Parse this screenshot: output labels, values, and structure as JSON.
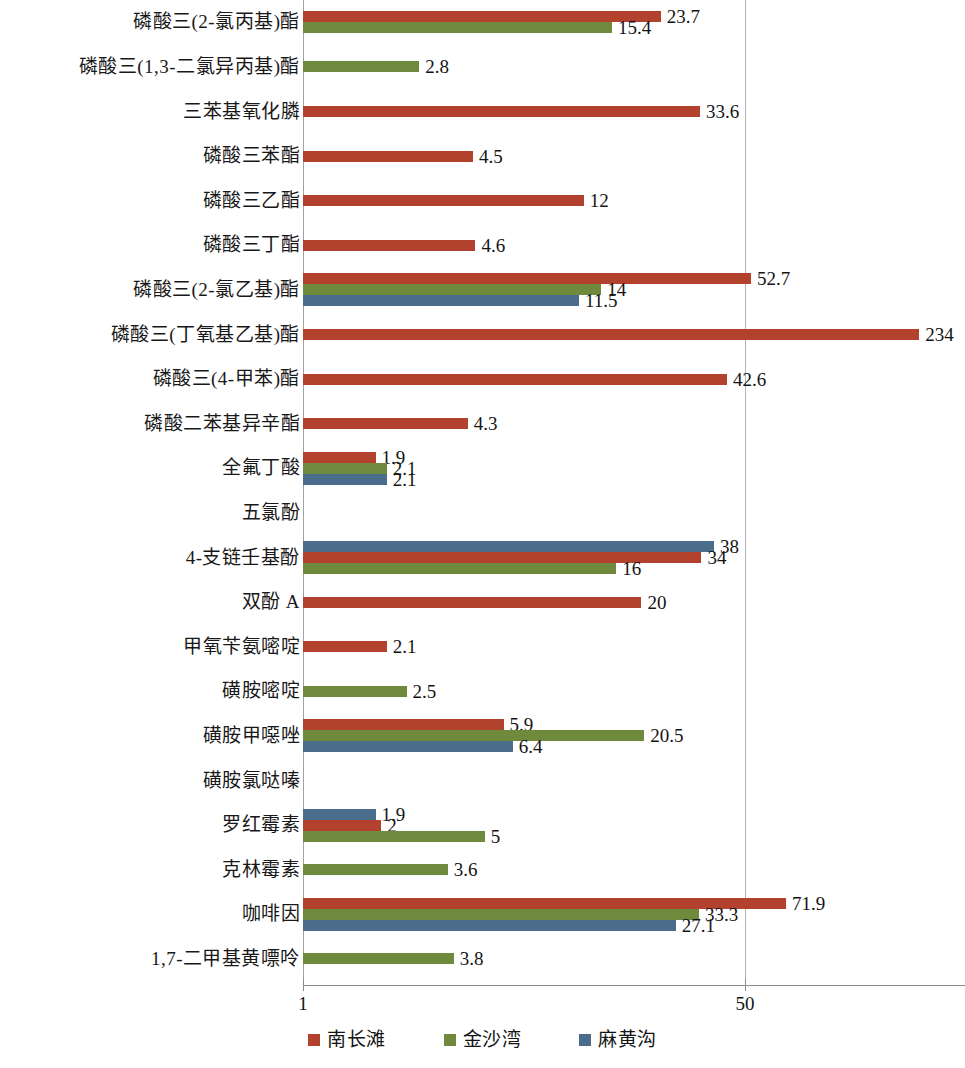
{
  "chart_data": {
    "type": "bar",
    "orientation": "horizontal",
    "title": "",
    "xlabel": "",
    "ylabel": "",
    "xscale": "log",
    "xlim": [
      1,
      300
    ],
    "xticks": [
      1,
      50
    ],
    "xticklabels": [
      "1",
      "50"
    ],
    "grid": true,
    "legend_position": "bottom",
    "colors": {
      "nanchangtan": "#b2412e",
      "jinshawan": "#6f8a3c",
      "mahuanggou": "#4a6d8c"
    },
    "series": [
      {
        "name": "南长滩",
        "color": "#b2412e"
      },
      {
        "name": "金沙湾",
        "color": "#6f8a3c"
      },
      {
        "name": "麻黄沟",
        "color": "#4a6d8c"
      }
    ],
    "categories": [
      "磷酸三(2-氯丙基)酯",
      "磷酸三(1,3-二氯异丙基)酯",
      "三苯基氧化膦",
      "磷酸三苯酯",
      "磷酸三乙酯",
      "磷酸三丁酯",
      "磷酸三(2-氯乙基)酯",
      "磷酸三(丁氧基乙基)酯",
      "磷酸三(4-甲苯)酯",
      "磷酸二苯基异辛酯",
      "全氟丁酸",
      "五氯酚",
      "4-支链壬基酚",
      "双酚 A",
      "甲氧苄氨嘧啶",
      "磺胺嘧啶",
      "磺胺甲噁唑",
      "磺胺氯哒嗪",
      "罗红霉素",
      "克林霉素",
      "咖啡因",
      "1,7-二甲基黄嘌呤"
    ],
    "rows": [
      {
        "category": "磷酸三(2-氯丙基)酯",
        "bars": [
          {
            "series": "南长滩",
            "value": 23.7,
            "label": "23.7"
          },
          {
            "series": "金沙湾",
            "value": 15.4,
            "label": "15.4"
          }
        ]
      },
      {
        "category": "磷酸三(1,3-二氯异丙基)酯",
        "bars": [
          {
            "series": "金沙湾",
            "value": 2.8,
            "label": "2.8"
          }
        ]
      },
      {
        "category": "三苯基氧化膦",
        "bars": [
          {
            "series": "南长滩",
            "value": 33.6,
            "label": "33.6"
          }
        ]
      },
      {
        "category": "磷酸三苯酯",
        "bars": [
          {
            "series": "南长滩",
            "value": 4.5,
            "label": "4.5"
          }
        ]
      },
      {
        "category": "磷酸三乙酯",
        "bars": [
          {
            "series": "南长滩",
            "value": 12,
            "label": "12"
          }
        ]
      },
      {
        "category": "磷酸三丁酯",
        "bars": [
          {
            "series": "南长滩",
            "value": 4.6,
            "label": "4.6"
          }
        ]
      },
      {
        "category": "磷酸三(2-氯乙基)酯",
        "bars": [
          {
            "series": "南长滩",
            "value": 52.7,
            "label": "52.7"
          },
          {
            "series": "金沙湾",
            "value": 14,
            "label": "14"
          },
          {
            "series": "麻黄沟",
            "value": 11.5,
            "label": "11.5"
          }
        ]
      },
      {
        "category": "磷酸三(丁氧基乙基)酯",
        "bars": [
          {
            "series": "南长滩",
            "value": 234,
            "label": "234"
          }
        ]
      },
      {
        "category": "磷酸三(4-甲苯)酯",
        "bars": [
          {
            "series": "南长滩",
            "value": 42.6,
            "label": "42.6"
          }
        ]
      },
      {
        "category": "磷酸二苯基异辛酯",
        "bars": [
          {
            "series": "南长滩",
            "value": 4.3,
            "label": "4.3"
          }
        ]
      },
      {
        "category": "全氟丁酸",
        "bars": [
          {
            "series": "南长滩",
            "value": 1.9,
            "label": "1.9"
          },
          {
            "series": "金沙湾",
            "value": 2.1,
            "label": "2.1"
          },
          {
            "series": "麻黄沟",
            "value": 2.1,
            "label": "2.1"
          }
        ]
      },
      {
        "category": "五氯酚",
        "bars": []
      },
      {
        "category": "4-支链壬基酚",
        "bars": [
          {
            "series": "麻黄沟",
            "value": 38,
            "label": "38"
          },
          {
            "series": "南长滩",
            "value": 34,
            "label": "34"
          },
          {
            "series": "金沙湾",
            "value": 16,
            "label": "16"
          }
        ]
      },
      {
        "category": "双酚 A",
        "bars": [
          {
            "series": "南长滩",
            "value": 20,
            "label": "20"
          }
        ]
      },
      {
        "category": "甲氧苄氨嘧啶",
        "bars": [
          {
            "series": "南长滩",
            "value": 2.1,
            "label": "2.1"
          }
        ]
      },
      {
        "category": "磺胺嘧啶",
        "bars": [
          {
            "series": "金沙湾",
            "value": 2.5,
            "label": "2.5"
          }
        ]
      },
      {
        "category": "磺胺甲噁唑",
        "bars": [
          {
            "series": "南长滩",
            "value": 5.9,
            "label": "5.9"
          },
          {
            "series": "金沙湾",
            "value": 20.5,
            "label": "20.5"
          },
          {
            "series": "麻黄沟",
            "value": 6.4,
            "label": "6.4"
          }
        ]
      },
      {
        "category": "磺胺氯哒嗪",
        "bars": []
      },
      {
        "category": "罗红霉素",
        "bars": [
          {
            "series": "麻黄沟",
            "value": 1.9,
            "label": "1.9"
          },
          {
            "series": "南长滩",
            "value": 2,
            "label": "2"
          },
          {
            "series": "金沙湾",
            "value": 5,
            "label": "5"
          }
        ]
      },
      {
        "category": "克林霉素",
        "bars": [
          {
            "series": "金沙湾",
            "value": 3.6,
            "label": "3.6"
          }
        ]
      },
      {
        "category": "咖啡因",
        "bars": [
          {
            "series": "南长滩",
            "value": 71.9,
            "label": "71.9"
          },
          {
            "series": "金沙湾",
            "value": 33.3,
            "label": "33.3"
          },
          {
            "series": "麻黄沟",
            "value": 27.1,
            "label": "27.1"
          }
        ]
      },
      {
        "category": "1,7-二甲基黄嘌呤",
        "bars": [
          {
            "series": "金沙湾",
            "value": 3.8,
            "label": "3.8"
          }
        ]
      }
    ]
  },
  "legend": {
    "items": [
      {
        "label": "南长滩",
        "color": "#b2412e"
      },
      {
        "label": "金沙湾",
        "color": "#6f8a3c"
      },
      {
        "label": "麻黄沟",
        "color": "#4a6d8c"
      }
    ]
  },
  "axis": {
    "ticks": [
      {
        "label": "1",
        "value": 1
      },
      {
        "label": "50",
        "value": 50
      }
    ]
  }
}
